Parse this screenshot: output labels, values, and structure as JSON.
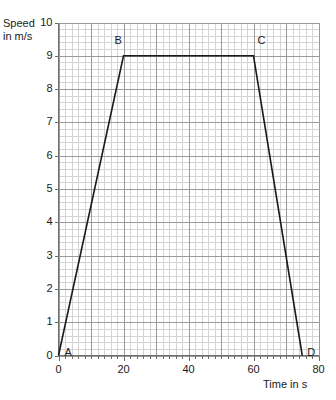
{
  "chart_data": {
    "type": "line",
    "title": "",
    "xlabel": "Time in s",
    "ylabel": "Speed in m/s",
    "ylabel_line1": "Speed",
    "ylabel_line2": "in m/s",
    "xlim": [
      0,
      80
    ],
    "ylim": [
      0,
      10
    ],
    "grid": true,
    "grid_major_x_step": 10,
    "grid_major_y_step": 1,
    "grid_minor_divisions": 5,
    "legend": "none",
    "xticks": [
      0,
      20,
      40,
      60,
      80
    ],
    "xtick_labels": [
      "0",
      "20",
      "40",
      "60",
      "80"
    ],
    "yticks": [
      0,
      1,
      2,
      3,
      4,
      5,
      6,
      7,
      8,
      9,
      10
    ],
    "ytick_labels": [
      "0",
      "1",
      "2",
      "3",
      "4",
      "5",
      "6",
      "7",
      "8",
      "9",
      "10"
    ],
    "series": [
      {
        "name": "speed-time",
        "color": "#1a1a1a",
        "x": [
          0,
          20,
          60,
          75
        ],
        "y": [
          0,
          9,
          9,
          0
        ]
      }
    ],
    "annotations": [
      {
        "label": "A",
        "x": 0,
        "y": 0,
        "dx": 6,
        "dy": -4
      },
      {
        "label": "B",
        "x": 20,
        "y": 9,
        "dx": -9,
        "dy": -16
      },
      {
        "label": "C",
        "x": 60,
        "y": 9,
        "dx": 4,
        "dy": -16
      },
      {
        "label": "D",
        "x": 75,
        "y": 0,
        "dx": 5,
        "dy": -4
      }
    ],
    "colors": {
      "line": "#1a1a1a",
      "grid_major": "#9a9a9a",
      "grid_minor": "#d4d4d4",
      "axis": "#6e6e6e",
      "text": "#1a1a1a",
      "background": "#ffffff"
    }
  }
}
